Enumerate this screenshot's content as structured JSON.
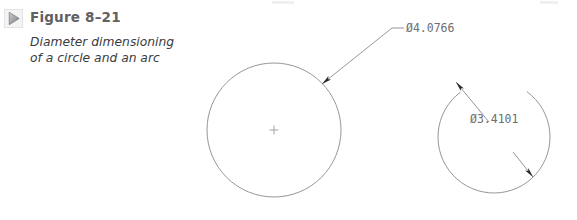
{
  "figure": {
    "icon": "triangle-right-icon",
    "title": "Figure 8–21",
    "caption_line1": "Diameter dimensioning",
    "caption_line2": "of a circle and an arc"
  },
  "colors": {
    "title": "#5f6163",
    "caption": "#3a3c3e",
    "geometry_line": "#8a8a8e",
    "dimension_line": "#8a8a8e",
    "dimension_text": "#6e6e72",
    "arrowhead": "#2b2b2e",
    "center_mark": "#9a9a9e",
    "icon_fill": "#9b9b9e",
    "background": "#ffffff"
  },
  "drawing": {
    "circle": {
      "name": "dimensioned-circle",
      "center_x": 274,
      "center_y": 130,
      "radius": 67,
      "center_mark": "+",
      "dimension_label": "Ø4.0766",
      "leader": {
        "arrow_x": 322,
        "arrow_y": 84,
        "elbow_x": 392,
        "elbow_y": 28,
        "shoulder_x": 404,
        "shoulder_y": 28
      },
      "label_x": 406,
      "label_y": 22
    },
    "arc": {
      "name": "dimensioned-arc",
      "center_x": 494,
      "center_y": 137,
      "radius": 56,
      "start_angle_deg": 127,
      "end_angle_deg": 414,
      "dimension_label": "Ø3.4101",
      "dimension_line": {
        "arrow1_x": 456,
        "arrow1_y": 82,
        "arrow2_x": 533,
        "arrow2_y": 177,
        "break_start_x": 489,
        "break_start_y": 122,
        "break_end_x": 513,
        "break_end_y": 152
      },
      "label_x": 470,
      "label_y": 113
    }
  }
}
